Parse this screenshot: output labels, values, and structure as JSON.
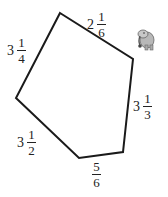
{
  "figure": {
    "type": "pentagon",
    "vertices": [
      [
        60,
        13
      ],
      [
        133,
        59
      ],
      [
        123,
        152
      ],
      [
        79,
        158
      ],
      [
        16,
        98
      ]
    ],
    "stroke_color": "#1a1a1a",
    "sides": [
      {
        "id": "top-right",
        "whole": "2",
        "numerator": "1",
        "denominator": "6"
      },
      {
        "id": "right",
        "whole": "3",
        "numerator": "1",
        "denominator": "3"
      },
      {
        "id": "bottom",
        "whole": "",
        "numerator": "5",
        "denominator": "6"
      },
      {
        "id": "bottom-left",
        "whole": "3",
        "numerator": "1",
        "denominator": "2"
      },
      {
        "id": "top-left",
        "whole": "3",
        "numerator": "1",
        "denominator": "4"
      }
    ]
  },
  "decoration": {
    "icon": "elephant-icon",
    "color": "#8a8a8a"
  }
}
